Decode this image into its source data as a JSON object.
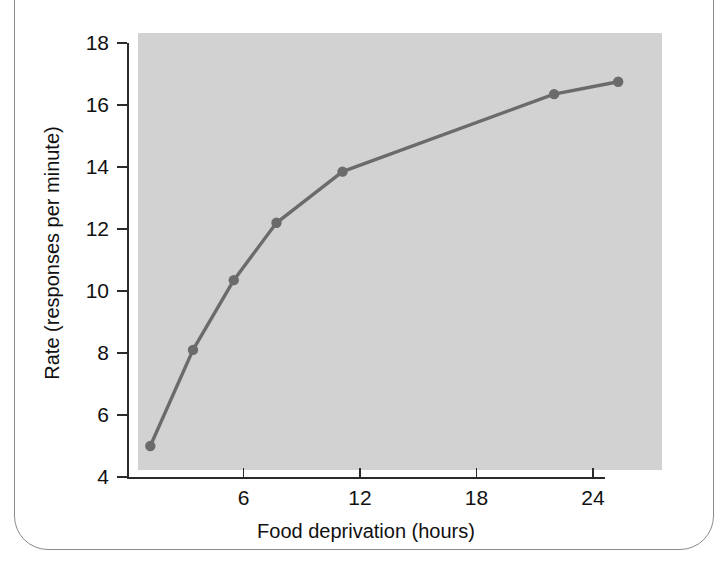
{
  "figure": {
    "top_caption": "",
    "frame_name": "rounded-page-border"
  },
  "chart_data": {
    "type": "line",
    "title": "",
    "subtitle": "",
    "xlabel": "Food deprivation (hours)",
    "ylabel": "Rate (responses per minute)",
    "xlim": [
      0,
      25.6
    ],
    "ylim": [
      4,
      18
    ],
    "xticks": [
      6,
      12,
      18,
      24
    ],
    "xticklabels": [
      "6",
      "12",
      "18",
      "24"
    ],
    "yticks": [
      4,
      6,
      8,
      10,
      12,
      14,
      16,
      18
    ],
    "yticklabels": [
      "4",
      "6",
      "8",
      "10",
      "12",
      "14",
      "16",
      "18"
    ],
    "grid": false,
    "legend": null,
    "legend_position": "none",
    "plot_background": "#d2d2d2",
    "series": [
      {
        "name": "Response rate",
        "color": "#6b6b6b",
        "marker": "circle",
        "x": [
          1.2,
          3.4,
          5.5,
          7.7,
          11.1,
          22.0,
          25.3
        ],
        "y": [
          5.0,
          8.1,
          10.35,
          12.2,
          13.85,
          16.35,
          16.75
        ]
      }
    ],
    "annotations": []
  },
  "colors": {
    "axis": "#2b2b2b",
    "line": "#6b6b6b",
    "marker": "#6b6b6b",
    "plot_bg": "#d2d2d2",
    "page_bg": "#ffffff",
    "frame": "#8a8a8a"
  }
}
